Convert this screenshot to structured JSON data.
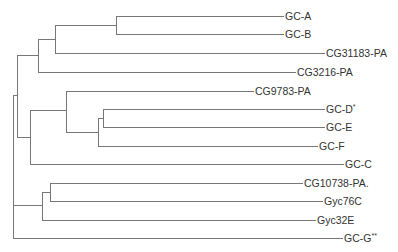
{
  "diagram": {
    "type": "phylogenetic-tree",
    "line_color": "#777777",
    "text_color": "#333333",
    "leaves": [
      {
        "id": "gc-a",
        "label": "GC-A",
        "mark": "",
        "y": 16,
        "x_end": 283
      },
      {
        "id": "gc-b",
        "label": "GC-B",
        "mark": "",
        "y": 34,
        "x_end": 283
      },
      {
        "id": "cg31183",
        "label": "CG31183-PA",
        "mark": "",
        "y": 53,
        "x_end": 324
      },
      {
        "id": "cg3216",
        "label": "CG3216-PA",
        "mark": "",
        "y": 72,
        "x_end": 295
      },
      {
        "id": "cg9783",
        "label": "CG9783-PA",
        "mark": "",
        "y": 91,
        "x_end": 253
      },
      {
        "id": "gc-d",
        "label": "GC-D",
        "mark": "*",
        "y": 109,
        "x_end": 324
      },
      {
        "id": "gc-e",
        "label": "GC-E",
        "mark": "",
        "y": 127,
        "x_end": 324
      },
      {
        "id": "gc-f",
        "label": "GC-F",
        "mark": "",
        "y": 146,
        "x_end": 317
      },
      {
        "id": "gc-c",
        "label": "GC-C",
        "mark": "",
        "y": 164,
        "x_end": 343
      },
      {
        "id": "cg10738",
        "label": "CG10738-PA.",
        "mark": "",
        "y": 183,
        "x_end": 302
      },
      {
        "id": "gyc76c",
        "label": "Gyc76C",
        "mark": "",
        "y": 201,
        "x_end": 322
      },
      {
        "id": "gyc32e",
        "label": "Gyc32E",
        "mark": "",
        "y": 220,
        "x_end": 315
      },
      {
        "id": "gc-g",
        "label": "GC-G",
        "mark": "**",
        "y": 238,
        "x_end": 342
      }
    ],
    "internal_nodes": [
      {
        "id": "n-ab",
        "x": 116,
        "y1": 16,
        "y2": 34,
        "stem_y": 25
      },
      {
        "id": "n-ab-31183",
        "x": 55,
        "y1": 25,
        "y2": 53,
        "stem_y": 39
      },
      {
        "id": "n-top",
        "x": 38,
        "y1": 39,
        "y2": 72,
        "stem_y": 55
      },
      {
        "id": "n-de",
        "x": 103,
        "y1": 109,
        "y2": 127,
        "stem_y": 118
      },
      {
        "id": "n-def",
        "x": 98,
        "y1": 118,
        "y2": 146,
        "stem_y": 132
      },
      {
        "id": "n-9783",
        "x": 66,
        "y1": 91,
        "y2": 132,
        "stem_y": 110
      },
      {
        "id": "n-mid",
        "x": 30,
        "y1": 110,
        "y2": 164,
        "stem_y": 137
      },
      {
        "id": "n-upper",
        "x": 17,
        "y1": 55,
        "y2": 137,
        "stem_y": 95
      },
      {
        "id": "n-gyc76",
        "x": 50,
        "y1": 183,
        "y2": 201,
        "stem_y": 192
      },
      {
        "id": "n-low",
        "x": 42,
        "y1": 192,
        "y2": 220,
        "stem_y": 205
      },
      {
        "id": "n-root",
        "x": 13,
        "y1": 95,
        "y2": 238,
        "stem_y": null
      }
    ],
    "edges": [
      {
        "from_x": 116,
        "y": 16,
        "to": "gc-a"
      },
      {
        "from_x": 116,
        "y": 34,
        "to": "gc-b"
      },
      {
        "from_x": 55,
        "y": 25,
        "to": "n-ab"
      },
      {
        "from_x": 55,
        "y": 53,
        "to": "cg31183"
      },
      {
        "from_x": 38,
        "y": 39,
        "to": "n-ab-31183"
      },
      {
        "from_x": 38,
        "y": 72,
        "to": "cg3216"
      },
      {
        "from_x": 17,
        "y": 55,
        "to": "n-top"
      },
      {
        "from_x": 66,
        "y": 91,
        "to": "cg9783"
      },
      {
        "from_x": 103,
        "y": 109,
        "to": "gc-d"
      },
      {
        "from_x": 103,
        "y": 127,
        "to": "gc-e"
      },
      {
        "from_x": 98,
        "y": 118,
        "to": "n-de"
      },
      {
        "from_x": 98,
        "y": 146,
        "to": "gc-f"
      },
      {
        "from_x": 66,
        "y": 132,
        "to": "n-def"
      },
      {
        "from_x": 30,
        "y": 110,
        "to": "n-9783"
      },
      {
        "from_x": 30,
        "y": 164,
        "to": "gc-c"
      },
      {
        "from_x": 17,
        "y": 137,
        "to": "n-mid"
      },
      {
        "from_x": 13,
        "y": 95,
        "to": "n-upper"
      },
      {
        "from_x": 50,
        "y": 183,
        "to": "cg10738"
      },
      {
        "from_x": 50,
        "y": 201,
        "to": "gyc76c"
      },
      {
        "from_x": 42,
        "y": 192,
        "to": "n-gyc76"
      },
      {
        "from_x": 42,
        "y": 220,
        "to": "gyc32e"
      },
      {
        "from_x": 13,
        "y": 205,
        "to": "n-low"
      },
      {
        "from_x": 13,
        "y": 238,
        "to": "gc-g"
      }
    ]
  }
}
